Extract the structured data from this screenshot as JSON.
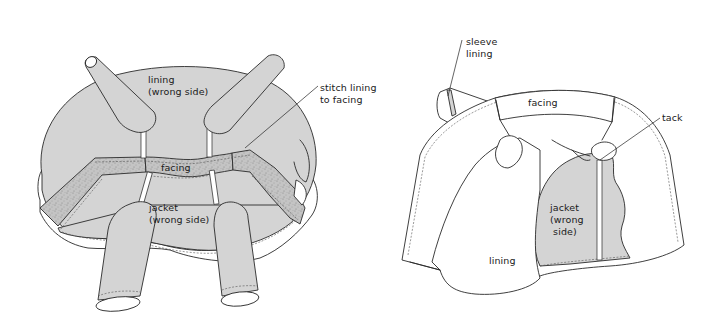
{
  "figure": {
    "left_panel": {
      "labels": {
        "lining": "lining\n(wrong side)",
        "stitch": "stitch lining\nto facing",
        "facing": "facing",
        "jacket": "jacket\n(wrong side)"
      }
    },
    "right_panel": {
      "labels": {
        "sleeve_lining": "sleeve\nlining",
        "facing": "facing",
        "tack": "tack",
        "jacket": "jacket\n(wrong\n side)",
        "lining": "lining"
      }
    },
    "colors": {
      "fabric_gray": "#d4d4d4",
      "line": "#2a2a2a",
      "background": "#ffffff"
    }
  }
}
